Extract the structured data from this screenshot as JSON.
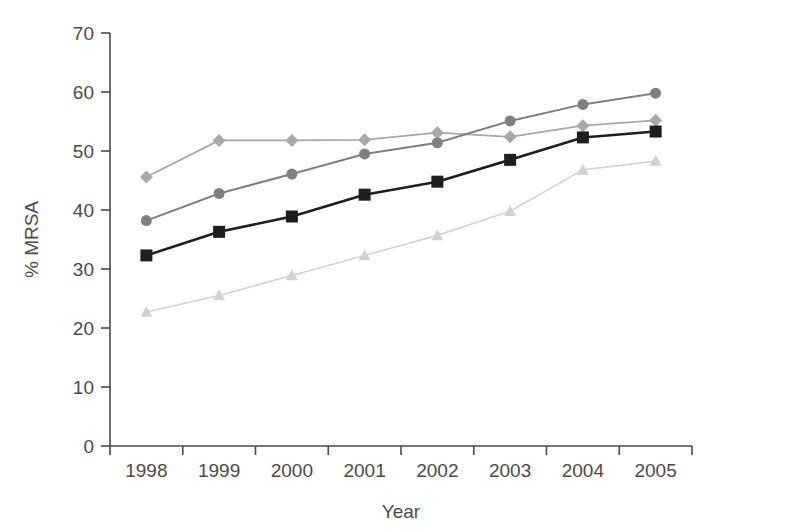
{
  "chart_data": {
    "type": "line",
    "title": "",
    "xlabel": "Year",
    "ylabel": "% MRSA",
    "categories": [
      "1998",
      "1999",
      "2000",
      "2001",
      "2002",
      "2003",
      "2004",
      "2005"
    ],
    "x": [
      1998,
      1999,
      2000,
      2001,
      2002,
      2003,
      2004,
      2005
    ],
    "ylim": [
      0,
      70
    ],
    "yticks": [
      0,
      10,
      20,
      30,
      40,
      50,
      60,
      70
    ],
    "ytick_labels": [
      "0",
      "10",
      "20",
      "30",
      "40",
      "50",
      "60",
      "70"
    ],
    "grid": false,
    "legend": "none",
    "series": [
      {
        "name": "series-circle",
        "marker": "circle",
        "color": "#808080",
        "line_width": 2.0,
        "marker_size": 11,
        "values": [
          38.2,
          42.8,
          46.1,
          49.5,
          51.4,
          55.1,
          57.9,
          59.8
        ]
      },
      {
        "name": "series-diamond",
        "marker": "diamond",
        "color": "#a8a8a8",
        "line_width": 1.8,
        "marker_size": 13,
        "values": [
          45.6,
          51.8,
          51.8,
          51.9,
          53.1,
          52.4,
          54.3,
          55.2
        ]
      },
      {
        "name": "series-square",
        "marker": "square",
        "color": "#1e1e1e",
        "line_width": 2.6,
        "marker_size": 12,
        "values": [
          32.3,
          36.3,
          38.9,
          42.6,
          44.8,
          48.5,
          52.3,
          53.3
        ]
      },
      {
        "name": "series-triangle",
        "marker": "triangle",
        "color": "#d2d2d2",
        "line_width": 1.6,
        "marker_size": 12,
        "values": [
          22.7,
          25.5,
          28.9,
          32.3,
          35.7,
          39.8,
          46.8,
          48.3
        ]
      }
    ]
  },
  "axes": {
    "y_axis_title": "% MRSA",
    "x_axis_title": "Year"
  },
  "colors": {
    "axis": "#4a4a4a",
    "text": "#4a4a4a",
    "background": "#ffffff"
  }
}
